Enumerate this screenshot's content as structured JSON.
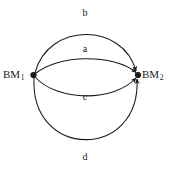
{
  "diagram": {
    "type": "directed-multigraph",
    "background_color": "#ffffff",
    "stroke_color": "#1a1a1a",
    "nodes": [
      {
        "id": "bm1",
        "name": "BM",
        "subscript": "1",
        "full_label": "BM1",
        "x": 33,
        "y": 75,
        "shape": "filled-dot"
      },
      {
        "id": "bm2",
        "name": "BM",
        "subscript": "2",
        "full_label": "BM2",
        "x": 138,
        "y": 75,
        "shape": "filled-dot"
      }
    ],
    "edges": [
      {
        "id": "edge-b",
        "label": "b",
        "from": "bm1",
        "to": "bm2",
        "arrowhead": "at-target",
        "curve": "arc-above-outer",
        "apex_y": 20
      },
      {
        "id": "edge-a",
        "label": "a",
        "from": "bm1",
        "to": "bm2",
        "arrowhead": "at-target",
        "curve": "arc-above-inner",
        "apex_y": 56
      },
      {
        "id": "edge-c",
        "label": "c",
        "from": "bm1",
        "to": "bm2",
        "arrowhead": "at-target",
        "curve": "arc-below-inner",
        "apex_y": 103
      },
      {
        "id": "edge-d",
        "label": "d",
        "from": "bm1",
        "to": "bm2",
        "arrowhead": "at-target",
        "curve": "arc-below-outer",
        "apex_y": 166
      }
    ]
  }
}
